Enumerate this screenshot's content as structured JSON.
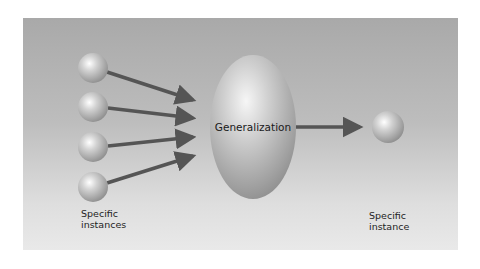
{
  "diagram": {
    "center_node": {
      "label": "Generalization"
    },
    "left_group": {
      "label_line1": "Specific",
      "label_line2": "instances",
      "sphere_count": 4
    },
    "right_node": {
      "label_line1": "Specific",
      "label_line2": "instance"
    },
    "colors": {
      "panel_top": "#a9a9a9",
      "panel_bottom": "#e9e9e9",
      "arrow": "#555555",
      "sphere_highlight": "#ffffff",
      "sphere_shadow": "#8c8c8c"
    }
  }
}
